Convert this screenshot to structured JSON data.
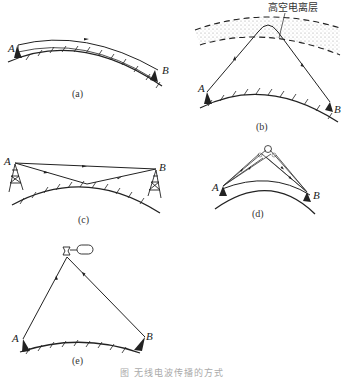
{
  "figure": {
    "caption": "图   无线电波传播的方式",
    "panels": [
      {
        "id": "a",
        "label": "(a)",
        "station_a": "A",
        "station_b": "B",
        "mode": "ground-wave"
      },
      {
        "id": "b",
        "label": "(b)",
        "station_a": "A",
        "station_b": "B",
        "mode": "sky-wave",
        "layer_label": "高空电离层"
      },
      {
        "id": "c",
        "label": "(c)",
        "station_a": "A",
        "station_b": "B",
        "mode": "line-of-sight"
      },
      {
        "id": "d",
        "label": "(d)",
        "station_a": "A",
        "station_b": "B",
        "mode": "scatter"
      },
      {
        "id": "e",
        "label": "(e)",
        "station_a": "A",
        "station_b": "B",
        "mode": "satellite"
      }
    ]
  }
}
